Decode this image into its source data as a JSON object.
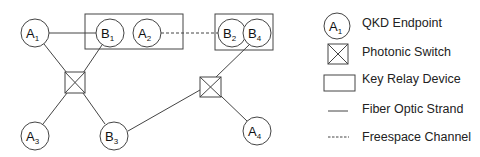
{
  "diagram": {
    "nodes": [
      {
        "id": "A1",
        "letter": "A",
        "sub": "1",
        "type": "qkd-endpoint",
        "cx": 35,
        "cy": 33
      },
      {
        "id": "B1",
        "letter": "B",
        "sub": "1",
        "type": "qkd-endpoint",
        "cx": 110,
        "cy": 33
      },
      {
        "id": "A2",
        "letter": "A",
        "sub": "2",
        "type": "qkd-endpoint",
        "cx": 147,
        "cy": 33
      },
      {
        "id": "B2",
        "letter": "B",
        "sub": "2",
        "type": "qkd-endpoint",
        "cx": 232,
        "cy": 33
      },
      {
        "id": "B4",
        "letter": "B",
        "sub": "4",
        "type": "qkd-endpoint",
        "cx": 257,
        "cy": 33
      },
      {
        "id": "A3",
        "letter": "A",
        "sub": "3",
        "type": "qkd-endpoint",
        "cx": 35,
        "cy": 136
      },
      {
        "id": "B3",
        "letter": "B",
        "sub": "3",
        "type": "qkd-endpoint",
        "cx": 114,
        "cy": 136
      },
      {
        "id": "A4",
        "letter": "A",
        "sub": "4",
        "type": "qkd-endpoint",
        "cx": 257,
        "cy": 131
      }
    ],
    "switches": [
      {
        "id": "S1",
        "x": 65,
        "y": 72,
        "w": 20,
        "h": 21
      },
      {
        "id": "S2",
        "x": 200,
        "y": 77,
        "w": 21,
        "h": 20
      }
    ],
    "relay_devices": [
      {
        "id": "R1",
        "x": 85,
        "y": 14,
        "w": 98,
        "h": 35,
        "contains": [
          "B1",
          "A2"
        ]
      },
      {
        "id": "R2",
        "x": 215,
        "y": 14,
        "w": 58,
        "h": 36,
        "contains": [
          "B2",
          "B4"
        ]
      }
    ],
    "edges": [
      {
        "from": "A1",
        "to": "B1",
        "type": "fiber"
      },
      {
        "from": "A2",
        "to": "B2",
        "type": "freespace"
      },
      {
        "from": "A1",
        "to": "S1",
        "type": "fiber"
      },
      {
        "from": "B1",
        "to": "S1",
        "type": "fiber"
      },
      {
        "from": "S1",
        "to": "A3",
        "type": "fiber"
      },
      {
        "from": "S1",
        "to": "B3",
        "type": "fiber"
      },
      {
        "from": "B3",
        "to": "S2",
        "type": "fiber"
      },
      {
        "from": "B4",
        "to": "S2",
        "type": "fiber"
      },
      {
        "from": "S2",
        "to": "A4",
        "type": "fiber"
      }
    ]
  },
  "legend": {
    "items": [
      {
        "key": "qkd-endpoint",
        "label": "QKD Endpoint",
        "symbol_letter": "A",
        "symbol_sub": "1"
      },
      {
        "key": "photonic-switch",
        "label": "Photonic Switch"
      },
      {
        "key": "key-relay-device",
        "label": "Key Relay Device"
      },
      {
        "key": "fiber-optic-strand",
        "label": "Fiber Optic Strand"
      },
      {
        "key": "freespace-channel",
        "label": "Freespace Channel"
      }
    ]
  },
  "colors": {
    "stroke": "#444444",
    "text": "#111111",
    "background": "#ffffff"
  }
}
